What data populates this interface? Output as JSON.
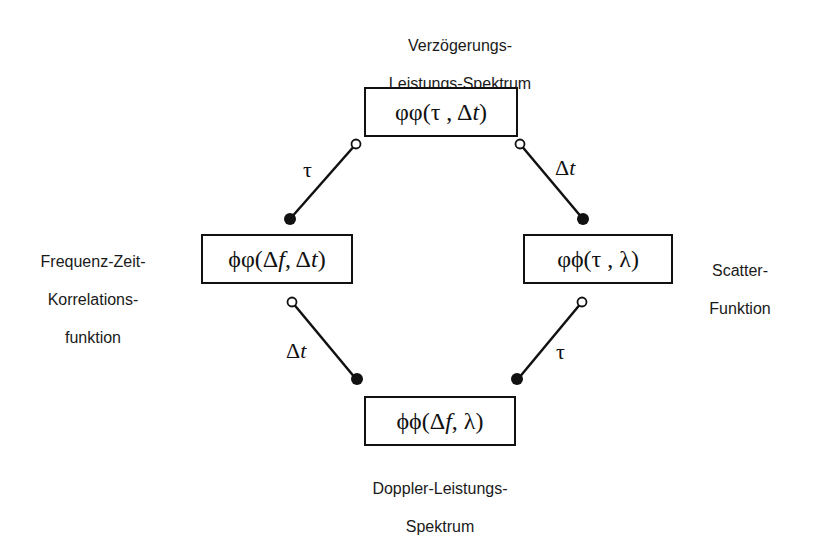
{
  "diagram": {
    "nodes": {
      "top": {
        "caption_line1": "Verzögerungs-",
        "caption_line2": "Leistungs-Spektrum",
        "formula_prefix": "φφ(τ , Δ",
        "formula_var": "t",
        "formula_suffix": ")"
      },
      "left": {
        "caption_line1": "Frequenz-Zeit-",
        "caption_line2": "Korrelations-",
        "caption_line3": "funktion",
        "formula_prefix": "ϕφ(Δ",
        "formula_var1": "f",
        "formula_mid": " , Δ",
        "formula_var2": "t",
        "formula_suffix": ")"
      },
      "right": {
        "caption_line1": "Scatter-",
        "caption_line2": "Funktion",
        "formula": "φϕ(τ , λ)"
      },
      "bottom": {
        "caption_line1": "Doppler-Leistungs-",
        "caption_line2": "Spektrum",
        "formula_prefix": "ϕϕ(Δ",
        "formula_var": "f",
        "formula_suffix": " , λ)"
      }
    },
    "edges": {
      "top_left": {
        "label": "τ",
        "from": "top",
        "to": "left"
      },
      "top_right": {
        "label_prefix": "Δ",
        "label_var": "t",
        "from": "top",
        "to": "right"
      },
      "bottom_left": {
        "label_prefix": "Δ",
        "label_var": "t",
        "from": "left",
        "to": "bottom"
      },
      "bottom_right": {
        "label": "τ",
        "from": "right",
        "to": "bottom"
      }
    },
    "colors": {
      "line": "#111111",
      "background": "#ffffff"
    }
  }
}
